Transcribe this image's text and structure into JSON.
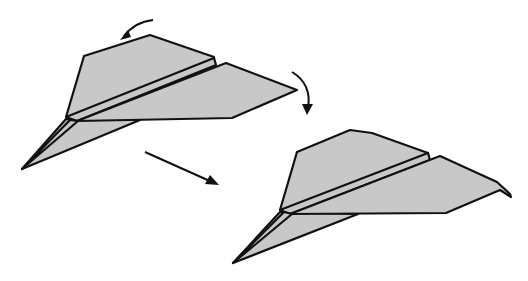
{
  "figure": {
    "fill_color": "#c8c8c8",
    "stroke_color": "#111111",
    "background": "#ffffff"
  },
  "steps": [
    {
      "label": "before"
    },
    {
      "label": "after"
    }
  ]
}
